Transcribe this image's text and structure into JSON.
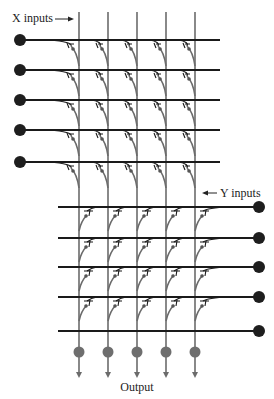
{
  "diagram": {
    "labels": {
      "x_inputs": "X inputs",
      "y_inputs": "Y inputs",
      "output": "Output"
    },
    "colors": {
      "input_line": "#1a1a1a",
      "column_line": "#6b6b6b",
      "input_dot": "#1e1e1e",
      "output_dot": "#6e6e6e",
      "synapse": "#555555"
    },
    "columns_x": [
      79,
      108,
      137,
      166,
      195
    ],
    "x_inputs": {
      "count": 5,
      "y": [
        40,
        70,
        100,
        130,
        162
      ],
      "dot_x": 20,
      "line_end_x": 220
    },
    "y_inputs": {
      "count": 5,
      "y": [
        207,
        238,
        267,
        297,
        331
      ],
      "dot_x": 259,
      "line_start_x": 58
    },
    "outputs": {
      "count": 5,
      "dot_y": 352,
      "arrow_end_y": 378
    }
  }
}
